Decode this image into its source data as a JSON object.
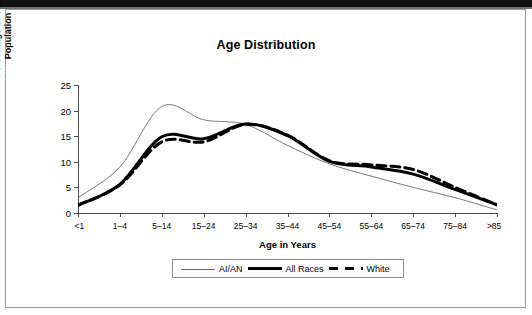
{
  "chart_data": {
    "type": "line",
    "title": "Age Distribution",
    "xlabel": "Age in Years",
    "ylabel_line1": "Percentage of Total",
    "ylabel_line2": "Population",
    "ylabel": "Percentage of Total Population",
    "categories": [
      "<1",
      "1–4",
      "5–14",
      "15–24",
      "25–34",
      "35–44",
      "45–54",
      "55–64",
      "65–74",
      "75–84",
      ">85"
    ],
    "ylim": [
      0,
      25
    ],
    "yticks": [
      0,
      5,
      10,
      15,
      20,
      25
    ],
    "ytick_labels": [
      "0",
      "5",
      "10",
      "15",
      "20",
      "25"
    ],
    "grid": false,
    "legend_position": "bottom",
    "series": [
      {
        "name": "AI/AN",
        "style": "thin-solid",
        "color": "#6a6a6a",
        "values": [
          3.0,
          9.0,
          20.8,
          18.2,
          17.3,
          13.2,
          9.6,
          7.2,
          5.0,
          3.0,
          0.6
        ]
      },
      {
        "name": "All Races",
        "style": "thick-solid",
        "color": "#000000",
        "values": [
          1.5,
          5.6,
          14.9,
          14.5,
          17.4,
          15.1,
          10.1,
          9.0,
          7.6,
          4.6,
          1.6
        ]
      },
      {
        "name": "White",
        "style": "dashed",
        "color": "#000000",
        "values": [
          1.5,
          5.5,
          13.9,
          13.9,
          17.3,
          15.2,
          10.2,
          9.4,
          8.5,
          5.0,
          1.6
        ]
      }
    ],
    "annotations": []
  },
  "legend": {
    "items": [
      {
        "label": "AI/AN",
        "swatch": "thin-solid-swatch"
      },
      {
        "label": "All Races",
        "swatch": "thick-solid-swatch"
      },
      {
        "label": "White",
        "swatch": "dashed-swatch"
      }
    ]
  }
}
